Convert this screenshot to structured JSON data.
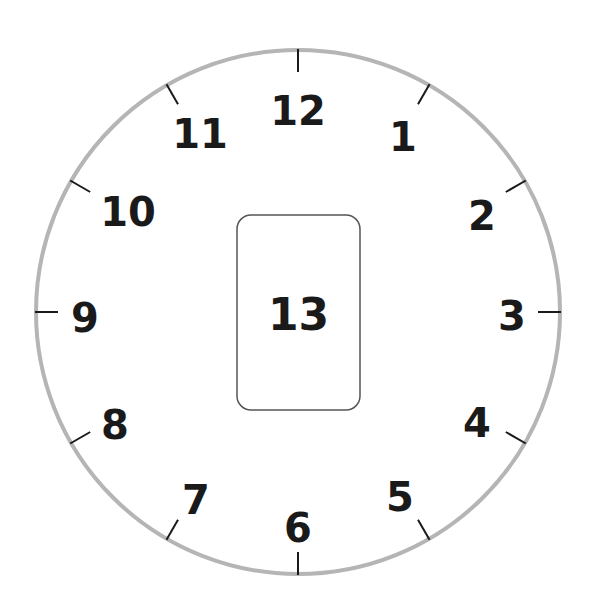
{
  "diagram": {
    "type": "clock-face",
    "canvas": {
      "width": 595,
      "height": 615
    },
    "center": {
      "x": 298,
      "y": 312
    },
    "radius": 262,
    "rim_color": "#b5b5b5",
    "rim_width": 4,
    "tick_color": "#1a1a1a",
    "tick_length": 22,
    "tick_width": 2,
    "numeral_font_size": 40,
    "numerals": [
      {
        "label": "12",
        "x": 298,
        "y": 111
      },
      {
        "label": "1",
        "x": 403,
        "y": 137
      },
      {
        "label": "2",
        "x": 482,
        "y": 216
      },
      {
        "label": "3",
        "x": 512,
        "y": 316
      },
      {
        "label": "4",
        "x": 477,
        "y": 423
      },
      {
        "label": "5",
        "x": 400,
        "y": 497
      },
      {
        "label": "6",
        "x": 298,
        "y": 528
      },
      {
        "label": "7",
        "x": 196,
        "y": 500
      },
      {
        "label": "8",
        "x": 115,
        "y": 425
      },
      {
        "label": "9",
        "x": 85,
        "y": 318
      },
      {
        "label": "10",
        "x": 128,
        "y": 212
      },
      {
        "label": "11",
        "x": 200,
        "y": 134
      }
    ],
    "center_box": {
      "label": "13",
      "x": 237,
      "y": 215,
      "width": 123,
      "height": 195,
      "corner_radius": 14,
      "border_color": "#555555",
      "font_size": 44
    }
  }
}
